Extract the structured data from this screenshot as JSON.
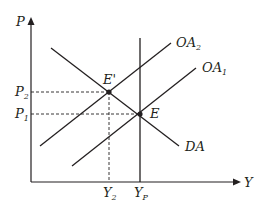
{
  "diagram": {
    "type": "aggregate-demand-supply",
    "axes": {
      "y_label": "P",
      "x_label": "Y"
    },
    "curves": [
      {
        "name": "OA",
        "sub": "2",
        "kind": "supply-shifted"
      },
      {
        "name": "OA",
        "sub": "1",
        "kind": "supply-original"
      },
      {
        "name": "DA",
        "sub": "",
        "kind": "demand"
      },
      {
        "name": "Y",
        "sub": "P",
        "kind": "potential-output-vertical"
      }
    ],
    "points": [
      {
        "label": "E'",
        "desc": "new equilibrium"
      },
      {
        "label": "E",
        "desc": "initial equilibrium"
      }
    ],
    "ticks": {
      "p": [
        {
          "name": "P",
          "sub": "2"
        },
        {
          "name": "P",
          "sub": "1"
        }
      ],
      "y": [
        {
          "name": "Y",
          "sub": "2"
        },
        {
          "name": "Y",
          "sub": "P"
        }
      ]
    },
    "colors": {
      "line": "#231f20",
      "background": "#ffffff"
    }
  }
}
